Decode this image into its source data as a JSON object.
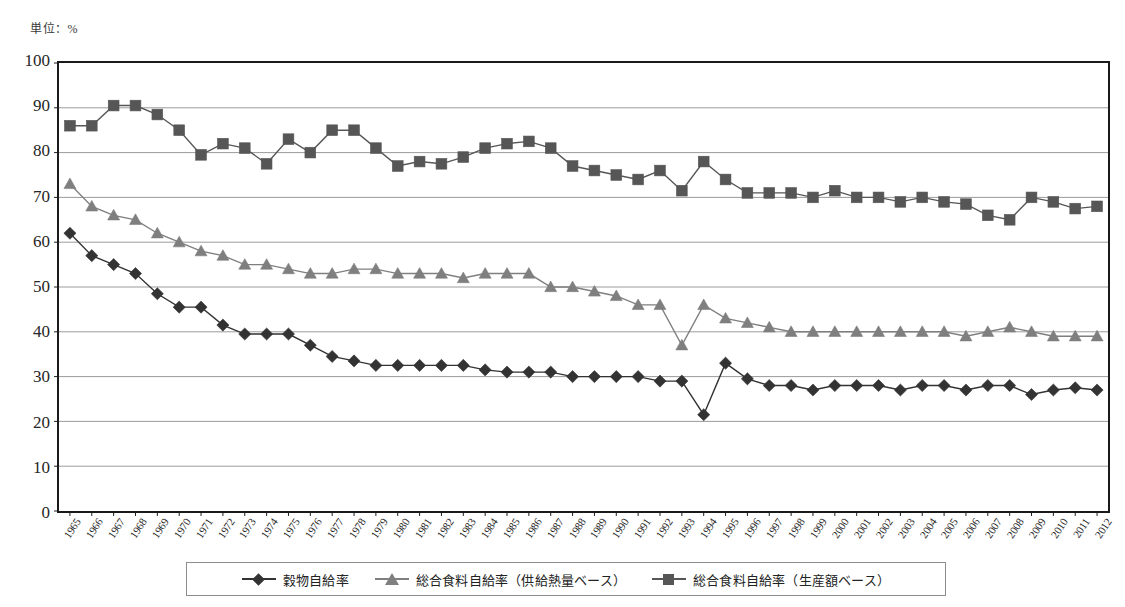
{
  "unit_caption": "単位：%",
  "legend": {
    "items": [
      {
        "label": "穀物自給率",
        "marker": "diamond",
        "color": "#333333"
      },
      {
        "label": "総合食料自給率（供給熱量ベース）",
        "marker": "triangle",
        "color": "#7f7f7f"
      },
      {
        "label": "総合食料自給率（生産額ベース）",
        "marker": "square",
        "color": "#565656"
      }
    ]
  },
  "chart_data": {
    "type": "line",
    "title": "",
    "subtitle": "",
    "xlabel": "",
    "ylabel": "単位：%",
    "ylim": [
      0,
      100
    ],
    "ytick_step": 10,
    "yticks": [
      0,
      10,
      20,
      30,
      40,
      50,
      60,
      70,
      80,
      90,
      100
    ],
    "grid": true,
    "grid_axis": "y",
    "legend_position": "bottom",
    "categories": [
      "1965",
      "1966",
      "1967",
      "1968",
      "1969",
      "1970",
      "1971",
      "1972",
      "1973",
      "1974",
      "1975",
      "1976",
      "1977",
      "1978",
      "1979",
      "1980",
      "1981",
      "1982",
      "1983",
      "1984",
      "1985",
      "1986",
      "1987",
      "1988",
      "1989",
      "1990",
      "1991",
      "1992",
      "1993",
      "1994",
      "1995",
      "1996",
      "1997",
      "1998",
      "1999",
      "2000",
      "2001",
      "2002",
      "2003",
      "2004",
      "2005",
      "2006",
      "2007",
      "2008",
      "2009",
      "2010",
      "2011",
      "2012"
    ],
    "series": [
      {
        "name": "穀物自給率",
        "marker": "diamond",
        "color": "#333333",
        "values": [
          62,
          57,
          55,
          53,
          48.5,
          45.5,
          45.5,
          41.5,
          39.5,
          39.5,
          39.5,
          37,
          34.5,
          33.5,
          32.5,
          32.5,
          32.5,
          32.5,
          32.5,
          31.5,
          31,
          31,
          31,
          30,
          30,
          30,
          30,
          29,
          29,
          21.5,
          33,
          29.5,
          28,
          28,
          27,
          28,
          28,
          28,
          27,
          28,
          28,
          27,
          28,
          28,
          26,
          27,
          27.5,
          27
        ]
      },
      {
        "name": "総合食料自給率（供給熱量ベース）",
        "marker": "triangle",
        "color": "#7f7f7f",
        "values": [
          73,
          68,
          66,
          65,
          62,
          60,
          58,
          57,
          55,
          55,
          54,
          53,
          53,
          54,
          54,
          53,
          53,
          53,
          52,
          53,
          53,
          53,
          50,
          50,
          49,
          48,
          46,
          46,
          37,
          46,
          43,
          42,
          41,
          40,
          40,
          40,
          40,
          40,
          40,
          40,
          40,
          39,
          40,
          41,
          40,
          39,
          39,
          39
        ]
      },
      {
        "name": "総合食料自給率（生産額ベース）",
        "marker": "square",
        "color": "#565656",
        "values": [
          86,
          86,
          90.5,
          90.5,
          88.5,
          85,
          79.5,
          82,
          81,
          77.5,
          83,
          80,
          85,
          85,
          81,
          77,
          78,
          77.5,
          79,
          81,
          82,
          82.5,
          81,
          77,
          76,
          75,
          74,
          76,
          71.5,
          78,
          74,
          71,
          71,
          71,
          70,
          71.5,
          70,
          70,
          69,
          70,
          69,
          68.5,
          66,
          65,
          70,
          69,
          67.5,
          68
        ]
      }
    ]
  }
}
